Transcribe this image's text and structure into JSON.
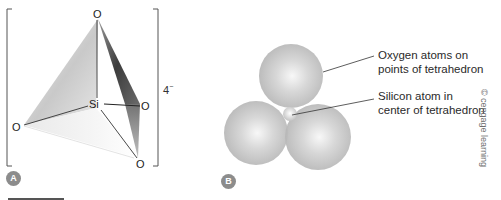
{
  "panels": {
    "a": {
      "badge": "A",
      "atoms": {
        "top": "O",
        "right": "O",
        "left": "O",
        "bottom": "O",
        "center": "Si"
      },
      "charge": {
        "value": "4",
        "sign": "−"
      }
    },
    "b": {
      "badge": "B",
      "callouts": [
        {
          "lines": [
            "Oxygen atoms on",
            "points of tetrahedron"
          ]
        },
        {
          "lines": [
            "Silicon atom in",
            "center of tetrahedron"
          ]
        }
      ]
    }
  },
  "copyright": "© cengage learning",
  "colors": {
    "sphere": "#bdbdbd",
    "sphere_highlight": "#f2f2f2",
    "badge": "#8c8c8c",
    "bond_line": "#333333",
    "face_dark": "#4a4a4a"
  }
}
